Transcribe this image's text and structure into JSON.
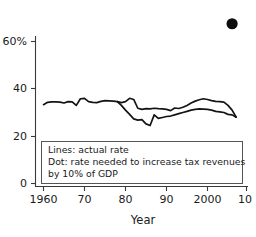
{
  "chart_data": {
    "type": "line",
    "title": "",
    "subtitle": "",
    "xlabel": "Year",
    "ylabel": "",
    "xlim": [
      1960,
      2012
    ],
    "ylim": [
      0,
      70
    ],
    "grid": false,
    "legend_position": "inside-bottom-left",
    "x_ticks": [
      {
        "value": 1960,
        "label": "1960"
      },
      {
        "value": 1970,
        "label": "70"
      },
      {
        "value": 1980,
        "label": "80"
      },
      {
        "value": 1990,
        "label": "90"
      },
      {
        "value": 2000,
        "label": "2000"
      },
      {
        "value": 2010,
        "label": "10"
      }
    ],
    "y_ticks": [
      {
        "value": 0,
        "label": "0"
      },
      {
        "value": 20,
        "label": "20"
      },
      {
        "value": 40,
        "label": "40"
      },
      {
        "value": 60,
        "label": "60%"
      }
    ],
    "series": [
      {
        "name": "actual rate (upper line)",
        "style": "line",
        "x": [
          1960,
          1961,
          1962,
          1963,
          1964,
          1965,
          1966,
          1967,
          1968,
          1969,
          1970,
          1971,
          1972,
          1973,
          1974,
          1975,
          1976,
          1977,
          1978,
          1979,
          1980,
          1981,
          1982,
          1983,
          1984,
          1985,
          1986,
          1987,
          1988,
          1989,
          1990,
          1991,
          1992,
          1993,
          1994,
          1995,
          1996,
          1997,
          1998,
          1999,
          2000,
          2001,
          2002,
          2003,
          2004,
          2005,
          2006,
          2007
        ],
        "values": [
          33.3,
          34.3,
          34.5,
          34.5,
          34.4,
          34.0,
          34.6,
          34.5,
          33.0,
          35.8,
          36.0,
          34.6,
          34.3,
          34.2,
          34.7,
          35.0,
          34.9,
          34.8,
          34.6,
          34.2,
          34.6,
          36.0,
          35.5,
          31.8,
          31.3,
          31.6,
          31.5,
          31.8,
          31.6,
          31.5,
          31.3,
          30.8,
          31.9,
          31.7,
          32.2,
          33.0,
          34.0,
          34.8,
          35.4,
          35.8,
          35.5,
          35.0,
          34.7,
          34.6,
          34.4,
          33.0,
          31.0,
          28.0
        ]
      },
      {
        "name": "actual rate (lower line)",
        "style": "line",
        "x": [
          1978,
          1979,
          1980,
          1981,
          1982,
          1983,
          1984,
          1985,
          1986,
          1987,
          1988,
          1989,
          1990,
          1991,
          1992,
          1993,
          1994,
          1995,
          1996,
          1997,
          1998,
          1999,
          2000,
          2001,
          2002,
          2003,
          2004,
          2005,
          2006,
          2007
        ],
        "values": [
          34.6,
          33.0,
          31.0,
          29.2,
          27.3,
          26.8,
          27.0,
          25.2,
          24.5,
          29.0,
          27.5,
          27.9,
          28.3,
          28.5,
          29.0,
          29.5,
          30.0,
          30.5,
          31.0,
          31.3,
          31.5,
          31.4,
          31.3,
          31.0,
          30.5,
          30.3,
          30.0,
          29.2,
          29.0,
          28.0
        ]
      }
    ],
    "points": [
      {
        "name": "rate needed to increase tax revenues by 10% of GDP",
        "style": "dot",
        "x": 2006,
        "y": 67.5
      }
    ],
    "legend_entries": [
      "Lines: actual rate",
      "Dot: rate needed to increase tax revenues",
      "by 10% of GDP"
    ]
  },
  "colors": {
    "line": "#141414",
    "dot": "#0d0d0d",
    "axis": "#3a3a3a",
    "legend_border": "#555555",
    "background": "#ffffff"
  }
}
